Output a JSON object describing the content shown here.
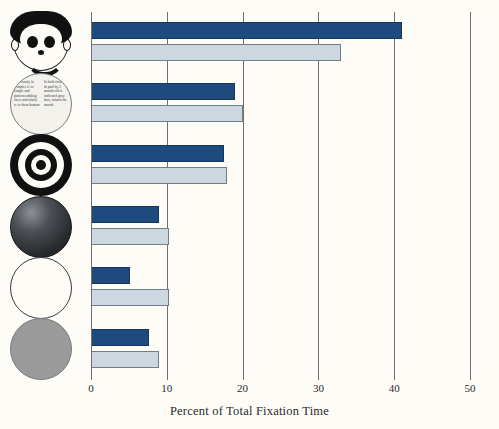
{
  "chart_data": {
    "type": "bar",
    "title": "",
    "xlabel": "Percent of Total Fixation Time",
    "ylabel": "",
    "xlim": [
      0,
      50
    ],
    "x_ticks": [
      0,
      10,
      20,
      30,
      40,
      50
    ],
    "grid": true,
    "orientation": "horizontal",
    "legend_position": "none",
    "categories": [
      "schematic face",
      "newsprint",
      "bullseye",
      "dark disc",
      "white disc",
      "gray disc"
    ],
    "series": [
      {
        "name": "2-month-old infants",
        "color": "#1e4a7d",
        "values": [
          41,
          19,
          17.5,
          9,
          5.2,
          7.7
        ]
      },
      {
        "name": "3-month-old infants",
        "color": "#ccd7df",
        "values": [
          33,
          20,
          18,
          10.3,
          10.3,
          9
        ]
      }
    ],
    "caption_note": "In both groups, fixation time paid by 2-month-old is indicated by the gray bars; infants the month..."
  },
  "axis": {
    "tick_labels": [
      "0",
      "10",
      "20",
      "30",
      "40",
      "50"
    ],
    "x_title": "Percent of Total Fixation Time"
  },
  "stimuli": [
    {
      "name": "schematic-face",
      "label": "schematic face"
    },
    {
      "name": "newsprint",
      "label": "newsprint"
    },
    {
      "name": "bullseye",
      "label": "bullseye"
    },
    {
      "name": "dark-disc",
      "label": "dark disc"
    },
    {
      "name": "white-disc",
      "label": "white disc"
    },
    {
      "name": "gray-disc",
      "label": "gray disc"
    }
  ],
  "newsprint_text": {
    "column_left": "ing viously in complex le to simple and patterns mbling faces articularly re to them bottom",
    "column_right": "In both fixation th paid by 2 month-old is indicated gray bars, infants the month"
  },
  "colors": {
    "series_dark": "#1e4a7d",
    "series_light": "#ccd7df",
    "grid": "#6f6f6f",
    "background": "#fdfcf7",
    "text": "#2b2b2b"
  }
}
